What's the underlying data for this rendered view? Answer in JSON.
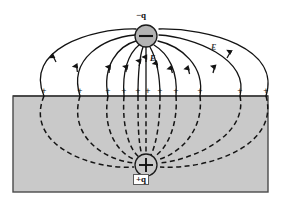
{
  "figure": {
    "background_color": "#ffffff",
    "conductor": {
      "name": "conductor-block",
      "fill_color": "#c9c9c9",
      "border_color": "#4a4a4a",
      "x": 13,
      "y": 96,
      "width": 255,
      "height": 96
    },
    "charges": [
      {
        "id": "negative-charge",
        "label": "−q",
        "sign": "−",
        "cx": 146,
        "cy": 36,
        "r": 11,
        "fill_color": "#b3b3b3",
        "stroke_color": "#1a1a1a"
      },
      {
        "id": "positive-image-charge",
        "label": "+q",
        "sign": "+",
        "cx": 146,
        "cy": 165,
        "r": 11,
        "fill_color": "#c9c9c9",
        "stroke_color": "#1a1a1a"
      }
    ],
    "field_label_center": "E",
    "field_label_right": "E",
    "surface_charge_symbol": "+",
    "surface_charge_count": 11,
    "surface_charge_y": 91,
    "surface_charge_x_positions": [
      44,
      80,
      108,
      124,
      138,
      148,
      160,
      176,
      200,
      240,
      266
    ],
    "field_line_color": "#1a1a1a",
    "field_line_count": 11
  },
  "chart_data": {
    "type": "diagram",
    "elements": {
      "negative_charge_position": [
        146,
        36
      ],
      "image_charge_position": [
        146,
        165
      ],
      "conductor_surface_y": 96,
      "conductor_extent_x": [
        13,
        268
      ],
      "conductor_extent_y": [
        96,
        192
      ],
      "field_lines_above_surface": 11,
      "field_lines_below_surface": 11,
      "arrow_direction": "toward the negative charge (upward)",
      "induced_surface_charges": 11
    },
    "labels": [
      "−q",
      "+q",
      "E",
      "E",
      "+"
    ]
  }
}
